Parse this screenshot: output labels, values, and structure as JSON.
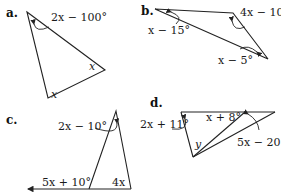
{
  "figures": [
    {
      "id": "a",
      "label": "a.",
      "angles": [
        "2x − 100°",
        "x",
        "x"
      ]
    },
    {
      "id": "b",
      "label": "b.",
      "angles": [
        "4x − 10°",
        "x − 15°",
        "x − 5°"
      ]
    },
    {
      "id": "c",
      "label": "c.",
      "angles": [
        "2x − 10°",
        "5x + 10°",
        "4x"
      ]
    },
    {
      "id": "d",
      "label": "d.",
      "angles": [
        "2x + 11°",
        "x + 8°",
        "5x − 20°",
        "y"
      ]
    }
  ]
}
